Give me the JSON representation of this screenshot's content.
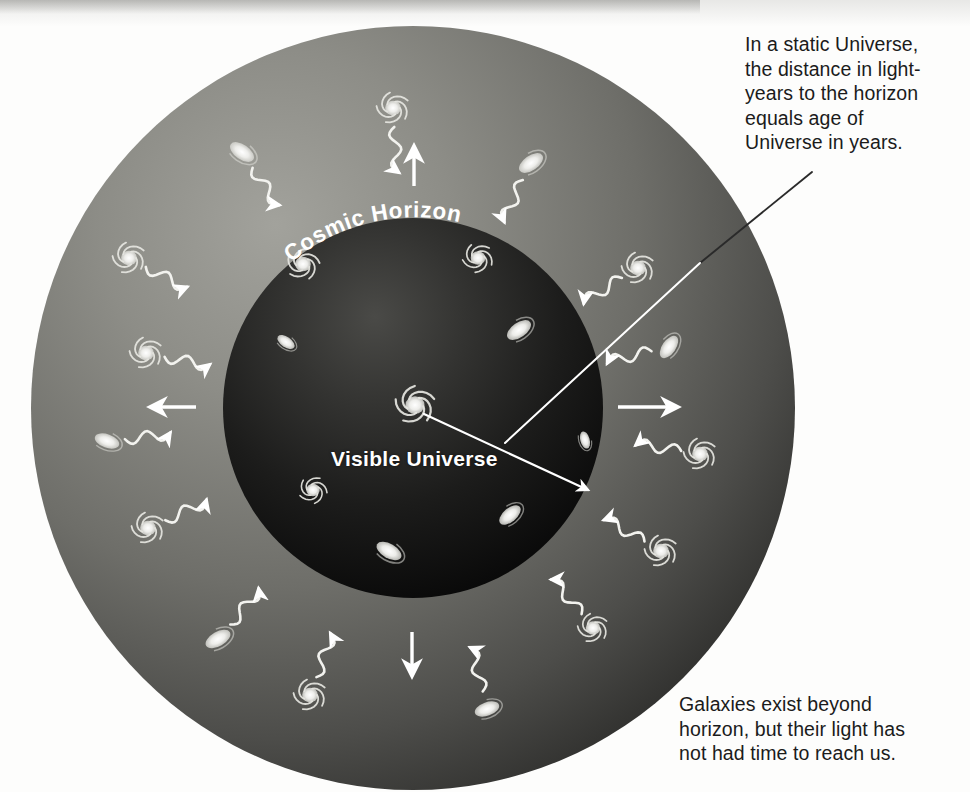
{
  "figure": {
    "labels": {
      "cosmic_horizon": "Cosmic Horizon",
      "visible_universe": "Visible Universe"
    },
    "callouts": {
      "top_right": "In a static Universe,\nthe distance in light-\nyears to the horizon\nequals age of\nUniverse in years.",
      "bottom_right": "Galaxies exist beyond\nhorizon, but their light has\nnot had time to reach us."
    },
    "colors": {
      "page_background": "#fdfdfc",
      "outer_sphere_light": "#8b8b86",
      "outer_sphere_dark": "#3a3a38",
      "inner_sphere_light": "#3b3b39",
      "inner_sphere_dark": "#0a0a0a",
      "galaxy": "#e8e8e4",
      "arrow": "#ffffff",
      "text": "#1b1b1b",
      "label_text": "#ffffff"
    },
    "geometry": {
      "outer_sphere": {
        "cx": 413,
        "cy": 408,
        "r": 382
      },
      "inner_sphere": {
        "cx": 413,
        "cy": 408,
        "r": 190
      },
      "leader_line_start": {
        "x": 812,
        "y": 172
      },
      "leader_line_junction": {
        "x": 505,
        "y": 443
      },
      "leader_arrow_end": {
        "x": 592,
        "y": 492
      },
      "observer_galaxy": {
        "x": 415,
        "y": 405
      }
    },
    "expansion_arrows": [
      {
        "name": "expansion-arrow-up",
        "direction": "up"
      },
      {
        "name": "expansion-arrow-down",
        "direction": "down"
      },
      {
        "name": "expansion-arrow-left",
        "direction": "left"
      },
      {
        "name": "expansion-arrow-right",
        "direction": "right"
      }
    ],
    "inner_galaxies": [
      {
        "x": 415,
        "y": 405,
        "r": 17,
        "type": "spiral",
        "rot": 10,
        "name": "observer-galaxy"
      },
      {
        "x": 303,
        "y": 264,
        "r": 14,
        "type": "spiral",
        "rot": 25
      },
      {
        "x": 478,
        "y": 258,
        "r": 13,
        "type": "spiral",
        "rot": -15
      },
      {
        "x": 286,
        "y": 342,
        "r": 10,
        "type": "ellipse",
        "rot": 35
      },
      {
        "x": 519,
        "y": 330,
        "r": 14,
        "type": "ellipse",
        "rot": -35
      },
      {
        "x": 389,
        "y": 551,
        "r": 14,
        "type": "ellipse",
        "rot": 30
      },
      {
        "x": 313,
        "y": 490,
        "r": 12,
        "type": "spiral",
        "rot": 40
      },
      {
        "x": 510,
        "y": 515,
        "r": 13,
        "type": "ellipse",
        "rot": -40
      },
      {
        "x": 585,
        "y": 440,
        "r": 9,
        "type": "ellipse",
        "rot": 75
      }
    ],
    "outer_galaxies": [
      {
        "x": 393,
        "y": 108,
        "r": 14,
        "type": "spiral",
        "rot": 0,
        "ray": 100
      },
      {
        "x": 242,
        "y": 152,
        "r": 14,
        "type": "ellipse",
        "rot": 35,
        "ray": 140
      },
      {
        "x": 531,
        "y": 163,
        "r": 14,
        "type": "ellipse",
        "rot": -35,
        "ray": 55
      },
      {
        "x": 129,
        "y": 258,
        "r": 14,
        "type": "spiral",
        "rot": 0,
        "ray": 160
      },
      {
        "x": 638,
        "y": 268,
        "r": 14,
        "type": "spiral",
        "rot": 0,
        "ray": 25
      },
      {
        "x": 146,
        "y": 353,
        "r": 14,
        "type": "spiral",
        "rot": 0,
        "ray": 175
      },
      {
        "x": 669,
        "y": 347,
        "r": 13,
        "type": "ellipse",
        "rot": -55,
        "ray": 8
      },
      {
        "x": 107,
        "y": 441,
        "r": 13,
        "type": "ellipse",
        "rot": 20,
        "ray": 195
      },
      {
        "x": 700,
        "y": 454,
        "r": 14,
        "type": "spiral",
        "rot": 0,
        "ray": 350
      },
      {
        "x": 148,
        "y": 528,
        "r": 14,
        "type": "spiral",
        "rot": 0,
        "ray": 215
      },
      {
        "x": 661,
        "y": 551,
        "r": 14,
        "type": "spiral",
        "rot": 0,
        "ray": 325
      },
      {
        "x": 218,
        "y": 639,
        "r": 14,
        "type": "ellipse",
        "rot": -30,
        "ray": 240
      },
      {
        "x": 593,
        "y": 628,
        "r": 13,
        "type": "spiral",
        "rot": 0,
        "ray": 305
      },
      {
        "x": 310,
        "y": 695,
        "r": 14,
        "type": "spiral",
        "rot": 0,
        "ray": 265
      },
      {
        "x": 487,
        "y": 709,
        "r": 13,
        "type": "ellipse",
        "rot": -20,
        "ray": 288
      }
    ]
  }
}
